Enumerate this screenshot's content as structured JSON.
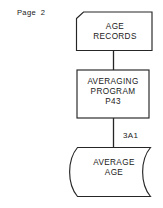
{
  "page": {
    "label": "Page  2"
  },
  "diagram": {
    "type": "data-flow-diagram",
    "stroke_color": "#262626",
    "background_color": "#ffffff",
    "nodes": [
      {
        "id": "age-records",
        "shape": "punched-card",
        "label": "AGE\nRECORDS"
      },
      {
        "id": "averaging-program",
        "shape": "rectangle",
        "label": "AVERAGING\nPROGRAM\nP43"
      },
      {
        "id": "average-age",
        "shape": "stored-data",
        "label": "AVERAGE\nAGE",
        "reference": "3A1"
      }
    ],
    "connectors": [
      {
        "id": "c1",
        "from": "age-records",
        "to": "averaging-program"
      },
      {
        "id": "c2",
        "from": "averaging-program",
        "to": "average-age"
      }
    ]
  }
}
